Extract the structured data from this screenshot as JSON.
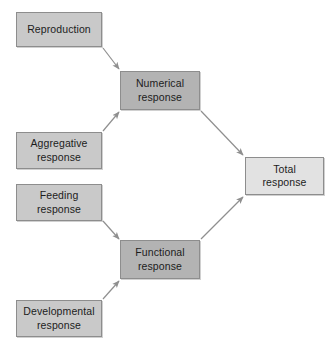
{
  "diagram": {
    "background_color": "#ffffff",
    "colors": {
      "input_box_fill": "#c9c9c9",
      "middle_box_fill": "#b3b3b3",
      "output_box_fill": "#e2e2e2",
      "box_border": "#8d8d8d",
      "arrow": "#8f8f8f",
      "text": "#1c1c1c"
    },
    "nodes": [
      {
        "id": "reproduction",
        "label": "Reproduction",
        "tier": "input",
        "x": 16,
        "y": 12,
        "w": 86,
        "h": 35
      },
      {
        "id": "aggregative-response",
        "label": "Aggregative\nresponse",
        "tier": "input",
        "x": 16,
        "y": 132,
        "w": 86,
        "h": 37
      },
      {
        "id": "feeding-response",
        "label": "Feeding\nresponse",
        "tier": "input",
        "x": 16,
        "y": 184,
        "w": 86,
        "h": 37
      },
      {
        "id": "developmental-response",
        "label": "Developmental\nresponse",
        "tier": "input",
        "x": 16,
        "y": 300,
        "w": 86,
        "h": 37
      },
      {
        "id": "numerical-response",
        "label": "Numerical\nresponse",
        "tier": "middle",
        "x": 120,
        "y": 71,
        "w": 80,
        "h": 39
      },
      {
        "id": "functional-response",
        "label": "Functional\nresponse",
        "tier": "middle",
        "x": 120,
        "y": 240,
        "w": 80,
        "h": 39
      },
      {
        "id": "total-response",
        "label": "Total\nresponse",
        "tier": "output",
        "x": 245,
        "y": 157,
        "w": 79,
        "h": 38
      }
    ],
    "edges": [
      {
        "id": "reproduction-to-numerical",
        "from": "reproduction",
        "to": "numerical-response",
        "x1": 103,
        "y1": 48,
        "x2": 119,
        "y2": 69
      },
      {
        "id": "aggregative-to-numerical",
        "from": "aggregative-response",
        "to": "numerical-response",
        "x1": 103,
        "y1": 131,
        "x2": 119,
        "y2": 112
      },
      {
        "id": "feeding-to-functional",
        "from": "feeding-response",
        "to": "functional-response",
        "x1": 103,
        "y1": 221,
        "x2": 119,
        "y2": 239
      },
      {
        "id": "developmental-to-functional",
        "from": "developmental-response",
        "to": "functional-response",
        "x1": 103,
        "y1": 299,
        "x2": 119,
        "y2": 281
      },
      {
        "id": "numerical-to-total",
        "from": "numerical-response",
        "to": "total-response",
        "x1": 201,
        "y1": 111,
        "x2": 243,
        "y2": 155
      },
      {
        "id": "functional-to-total",
        "from": "functional-response",
        "to": "total-response",
        "x1": 201,
        "y1": 239,
        "x2": 243,
        "y2": 197
      }
    ]
  }
}
